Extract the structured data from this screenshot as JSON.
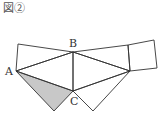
{
  "figure": {
    "title": "図②",
    "labels": {
      "A": "A",
      "B": "B",
      "C": "C"
    },
    "colors": {
      "stroke": "#333333",
      "shaded": "#c8c8c8",
      "background": "#ffffff"
    }
  }
}
